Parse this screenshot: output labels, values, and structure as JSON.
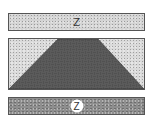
{
  "diagram": {
    "type": "stratigraphic-cross-section",
    "layers": [
      {
        "id": "top-band",
        "label": "Z",
        "fill": "light-stippled",
        "color": "#d4d4d4"
      },
      {
        "id": "middle-block",
        "label": "",
        "fill": "light-stippled",
        "color": "#dadada",
        "inner_shape": {
          "shape": "trapezoid",
          "fill": "dark-basketweave",
          "color": "#5a5a5a"
        }
      },
      {
        "id": "bottom-band",
        "label": "Z",
        "label_style": "circled",
        "fill": "dark-mottled",
        "color": "#8f8f8f"
      }
    ]
  },
  "colors": {
    "border": "#555555",
    "weave_dark": "#4a4a4a",
    "weave_light": "#8a8a8a"
  }
}
